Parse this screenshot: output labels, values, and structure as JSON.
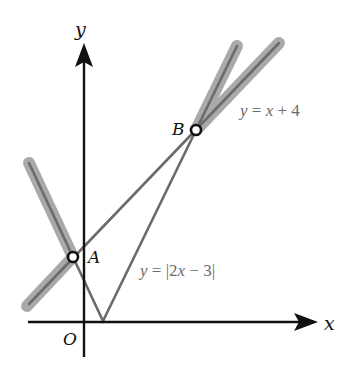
{
  "diagram": {
    "axes": {
      "x_label": "x",
      "y_label": "y",
      "origin_label": "O",
      "color": "#111111"
    },
    "points": [
      {
        "name": "A",
        "label": "A"
      },
      {
        "name": "B",
        "label": "B"
      }
    ],
    "curves": [
      {
        "id": "line",
        "equation_label": "y = x + 4",
        "lhs": "y",
        "eq": " = ",
        "var": "x",
        "rest": " + 4",
        "color": "#6b6b6b"
      },
      {
        "id": "abs",
        "equation_label": "y = |2x − 3|",
        "lhs": "y",
        "eq": " = |2",
        "var": "x",
        "rest": " − 3|",
        "color": "#6b6b6b"
      }
    ],
    "highlight_color": "#a9a9a9",
    "line_color": "#6b6b6b"
  }
}
